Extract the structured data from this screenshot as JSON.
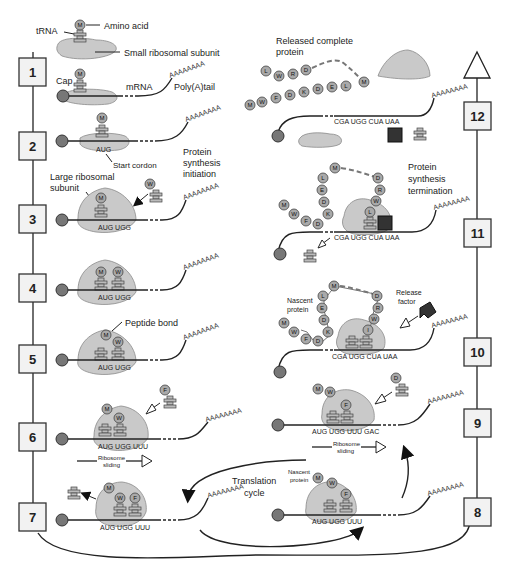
{
  "diagram": {
    "steps": [
      {
        "n": "1",
        "x": 14,
        "y": 178
      },
      {
        "n": "2",
        "x": 14,
        "y": 141
      },
      {
        "n": "3",
        "x": 14,
        "y": 218
      },
      {
        "n": "4",
        "x": 14,
        "y": 288
      },
      {
        "n": "5",
        "x": 14,
        "y": 358
      },
      {
        "n": "6",
        "x": 14,
        "y": 430
      },
      {
        "n": "7",
        "x": 14,
        "y": 510
      }
    ],
    "right_steps": [
      {
        "n": "12",
        "x": 470,
        "y": 64
      },
      {
        "n": "11",
        "x": 470,
        "y": 218
      },
      {
        "n": "10",
        "x": 470,
        "y": 337
      },
      {
        "n": "9",
        "x": 470,
        "y": 418
      },
      {
        "n": "8",
        "x": 470,
        "y": 496
      }
    ],
    "labels": {
      "trna": "tRNA",
      "amino_acid": "Amino acid",
      "small_subunit": "Small ribosomal subunit",
      "cap": "Cap",
      "mrna": "mRNA",
      "polya": "Poly(A)tail",
      "start_codon": "Start cordon",
      "initiation_1": "Protein",
      "initiation_2": "synthesis",
      "initiation_3": "initiation",
      "large_subunit_1": "Large ribosomal",
      "large_subunit_2": "subunit",
      "peptide_bond": "Peptide bond",
      "ribosome_sliding_1": "Ribosome",
      "ribosome_sliding_2": "sliding",
      "translation_cycle_1": "Translation",
      "translation_cycle_2": "cycle",
      "nascent_protein_1": "Nascent",
      "nascent_protein_2": "protein",
      "release_factor_1": "Release",
      "release_factor_2": "factor",
      "termination_1": "Protein",
      "termination_2": "synthesis",
      "termination_3": "termination",
      "released_1": "Released complete",
      "released_2": "protein",
      "polya_glyph": "AAAAAAAA"
    },
    "codons": {
      "aug": "AUG",
      "aug_ugg": "AUG UGG",
      "aug_ugg_uuu": "AUG UGG UUU",
      "aug_ugg_uuu_gac": "AUG UGG UUU GAC",
      "stop": "CGA UGG CUA UAA"
    },
    "amino_acids": {
      "met": "M",
      "trp": "W",
      "phe": "F",
      "asp": "D",
      "lys": "K",
      "glu": "E",
      "leu": "L",
      "arg": "R",
      "ile": "I"
    },
    "released_chain_top": [
      "L",
      "W",
      "R",
      "D"
    ],
    "released_chain_bottom": [
      "M",
      "W",
      "F",
      "D",
      "K",
      "D",
      "E",
      "L",
      "M"
    ],
    "colors": {
      "ribosome": "#c9c9c9",
      "amino_acid": "#a9a9a9",
      "cap": "#777777",
      "release_factor": "#333333",
      "line": "#222222"
    }
  }
}
